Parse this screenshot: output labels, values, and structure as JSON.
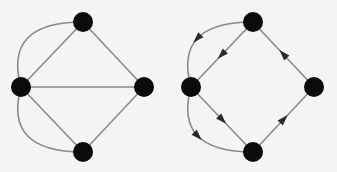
{
  "diagrams": [
    {
      "id": "undirected",
      "directed": false,
      "nodes": [
        "top",
        "left",
        "right",
        "bottom"
      ],
      "edges": [
        {
          "from": "top",
          "to": "left",
          "curved": false
        },
        {
          "from": "top",
          "to": "left",
          "curved": true
        },
        {
          "from": "left",
          "to": "right",
          "curved": false
        },
        {
          "from": "top",
          "to": "right",
          "curved": false
        },
        {
          "from": "left",
          "to": "bottom",
          "curved": false
        },
        {
          "from": "left",
          "to": "bottom",
          "curved": true
        },
        {
          "from": "bottom",
          "to": "right",
          "curved": false
        }
      ]
    },
    {
      "id": "directed",
      "directed": true,
      "nodes": [
        "top",
        "left",
        "right",
        "bottom"
      ],
      "edges": [
        {
          "from": "top",
          "to": "left",
          "curved": false
        },
        {
          "from": "top",
          "to": "left",
          "curved": true
        },
        {
          "from": "left",
          "to": "bottom",
          "curved": false
        },
        {
          "from": "left",
          "to": "bottom",
          "curved": true
        },
        {
          "from": "bottom",
          "to": "right",
          "curved": false
        },
        {
          "from": "right",
          "to": "top",
          "curved": false
        }
      ]
    }
  ],
  "colors": {
    "node": "#0b0b0b",
    "edge": "#8a8a8a",
    "arrow": "#2a2a2a",
    "background": "#f4f4f4"
  }
}
